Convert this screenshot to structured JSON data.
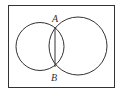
{
  "diagram": {
    "type": "venn",
    "colors": {
      "stroke": "#333333",
      "background": "#ffffff"
    },
    "frame": {
      "x": 8,
      "y": 5,
      "width": 106,
      "height": 82
    },
    "circles": [
      {
        "name": "left",
        "cx": 40,
        "cy": 46.5,
        "r": 24
      },
      {
        "name": "right",
        "cx": 78,
        "cy": 46,
        "r": 29
      }
    ],
    "chord": {
      "x1": 55,
      "y1": 27,
      "x2": 55,
      "y2": 67
    },
    "points": [
      {
        "label": "A",
        "x": 57,
        "y": 22
      },
      {
        "label": "B",
        "x": 51,
        "y": 80
      }
    ]
  }
}
